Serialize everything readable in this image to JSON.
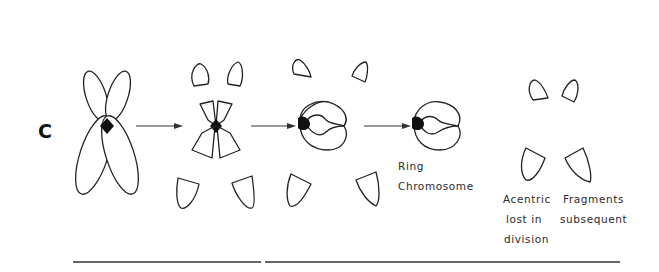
{
  "figure": {
    "panel_label": "C",
    "stages": [
      {
        "id": "intact",
        "description": "Chromosome with two chromatids joined at centromere"
      },
      {
        "id": "breaks",
        "description": "Breaks in both arms producing four pairs of acentric fragments"
      },
      {
        "id": "rejoin",
        "description": "Broken ends rejoin forming a ring"
      },
      {
        "id": "ring",
        "description": "Ring chromosome"
      },
      {
        "id": "fragments",
        "description": "Acentric fragments"
      }
    ],
    "labels": {
      "ring_line1": "Ring",
      "ring_line2": "Chromosome",
      "frag_line1_a": "Acentric",
      "frag_line1_b": "Fragments",
      "frag_line2_a": "lost  in",
      "frag_line2_b": "subsequent",
      "frag_line3": "division"
    },
    "colors": {
      "ink": "#222222",
      "background": "#ffffff"
    }
  }
}
